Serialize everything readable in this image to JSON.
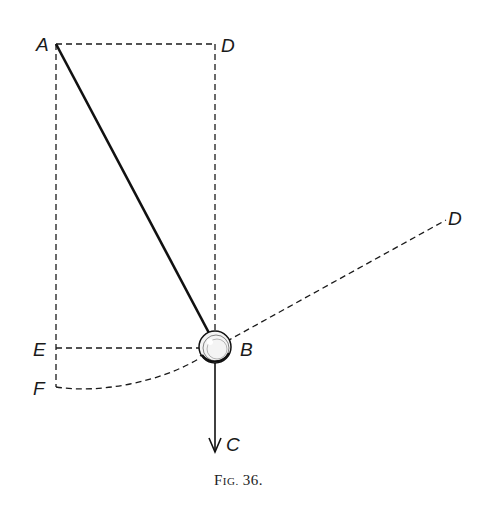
{
  "figure": {
    "caption": "Fig. 36.",
    "caption_prefix": "F",
    "caption_small": "IG.",
    "caption_number": "36.",
    "labels": {
      "A": "A",
      "D_top": "D",
      "D_right": "D",
      "B": "B",
      "C": "C",
      "E": "E",
      "F": "F"
    },
    "elements": {
      "pendulum_rod": "solid line A to B",
      "bob": "sphere at B",
      "force_arrow": "B downward to C",
      "construction_lines": [
        "A-D rectangle dashed",
        "E-B horizontal dashed",
        "F-B arc dashed",
        "B-D tangent dashed"
      ]
    }
  }
}
